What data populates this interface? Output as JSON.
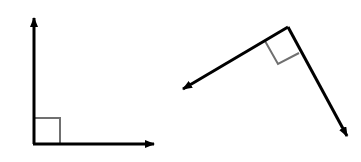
{
  "diagram": {
    "colors": {
      "ray": "#000000",
      "marker": "#707070",
      "background": "#ffffff"
    },
    "figures": [
      {
        "name": "upright-right-angle",
        "vertex": [
          34,
          144
        ],
        "ray_tips": [
          [
            34,
            17
          ],
          [
            155,
            144
          ]
        ],
        "right_angle_marker": [
          [
            34,
            118
          ],
          [
            60,
            118
          ],
          [
            60,
            144
          ]
        ]
      },
      {
        "name": "rotated-right-angle",
        "vertex": [
          288,
          27
        ],
        "ray_tips": [
          [
            182,
            89
          ],
          [
            348,
            137
          ]
        ],
        "right_angle_marker": [
          [
            265,
            41
          ],
          [
            278,
            64
          ],
          [
            299,
            53
          ]
        ]
      }
    ]
  }
}
